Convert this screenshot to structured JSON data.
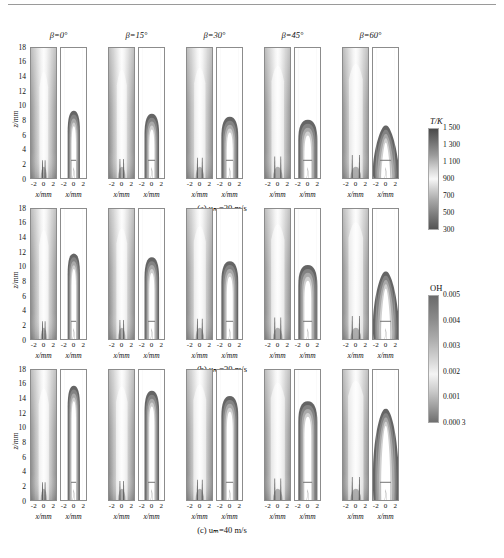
{
  "figure": {
    "type": "multi-panel-contour-field",
    "columns": [
      {
        "label": "β=0°",
        "beta_deg": 0
      },
      {
        "label": "β=15°",
        "beta_deg": 15
      },
      {
        "label": "β=30°",
        "beta_deg": 30
      },
      {
        "label": "β=45°",
        "beta_deg": 45
      },
      {
        "label": "β=60°",
        "beta_deg": 60
      }
    ],
    "rows": [
      {
        "caption": "(a)  uₘ=20 m/s",
        "u_m": 20,
        "unit": "m/s"
      },
      {
        "caption": "(b)  uₘ=30 m/s",
        "u_m": 30,
        "unit": "m/s"
      },
      {
        "caption": "(c)  uₘ=40 m/s",
        "u_m": 40,
        "unit": "m/s"
      }
    ],
    "axes": {
      "y_label": "z/mm",
      "y_ticks": [
        "18",
        "16",
        "14",
        "12",
        "10",
        "8",
        "6",
        "4",
        "2",
        "0"
      ],
      "y_values": [
        18,
        16,
        14,
        12,
        10,
        8,
        6,
        4,
        2,
        0
      ],
      "y_range": [
        0,
        18
      ],
      "x_label": "x/mm",
      "x_ticks": [
        "-2",
        "0",
        "2"
      ],
      "x_values": [
        -2,
        0,
        2
      ],
      "x_range": [
        -3,
        3
      ]
    },
    "colorbars": [
      {
        "name": "temperature",
        "title": "T/K",
        "title_italic_part": "T",
        "ticks": [
          "1 500",
          "1 300",
          "1 100",
          "900",
          "700",
          "500",
          "300"
        ],
        "values": [
          1500,
          1300,
          1100,
          900,
          700,
          500,
          300
        ],
        "min": 300,
        "max": 1500,
        "unit": "K"
      },
      {
        "name": "oh-mass-fraction",
        "title": "OH",
        "ticks": [
          "0.005",
          "0.004",
          "0.003",
          "0.002",
          "0.001",
          "0.000 3"
        ],
        "values": [
          0.005,
          0.004,
          0.003,
          0.002,
          0.001,
          0.0003
        ],
        "min": 0.0003,
        "max": 0.005,
        "unit": ""
      }
    ],
    "panel_pair_note": "each beta column contains a left temperature field panel and a right OH field panel"
  },
  "chart_data": {
    "type": "heatmap",
    "title": "",
    "xlabel": "x/mm",
    "ylabel": "z/mm",
    "xlim": [
      -3,
      3
    ],
    "ylim": [
      0,
      18
    ],
    "grid": false,
    "legend_position": "right",
    "categories": [
      "β=0°",
      "β=15°",
      "β=30°",
      "β=45°",
      "β=60°"
    ],
    "series": [
      {
        "name": "(a) u_m=20 m/s  flame tip height z/mm (OH)",
        "values": [
          9.5,
          10.0,
          8.5,
          8.0,
          8.2
        ]
      },
      {
        "name": "(b) u_m=30 m/s  flame tip height z/mm (OH)",
        "values": [
          12.0,
          12.5,
          10.5,
          10.0,
          10.5
        ]
      },
      {
        "name": "(c) u_m=40 m/s  flame tip height z/mm (OH)",
        "values": [
          16.5,
          17.0,
          15.0,
          13.5,
          16.0
        ]
      }
    ],
    "colorbars": {
      "temperature_K": [
        300,
        500,
        700,
        900,
        1100,
        1300,
        1500
      ],
      "OH_mass_fraction": [
        0.0003,
        0.001,
        0.002,
        0.003,
        0.004,
        0.005
      ]
    }
  }
}
